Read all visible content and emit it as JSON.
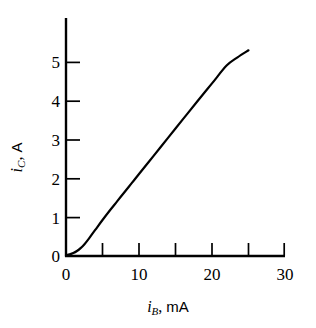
{
  "chart_data": {
    "type": "line",
    "title": "",
    "subtitle": "",
    "xlabel": "i_B, mA",
    "ylabel": "i_C, A",
    "xlabel_parts": {
      "symbol": "i",
      "subscript": "B",
      "separator": ",",
      "unit": "mA"
    },
    "ylabel_parts": {
      "symbol": "i",
      "subscript": "C",
      "separator": ",",
      "unit": "A"
    },
    "xlim": [
      0,
      30
    ],
    "ylim": [
      0,
      5.75
    ],
    "xticks": [
      0,
      10,
      20,
      30
    ],
    "xtick_labels": [
      "0",
      "10",
      "20",
      "30"
    ],
    "x_minor_ticks": [
      5,
      15,
      25
    ],
    "yticks": [
      0,
      1,
      2,
      3,
      4,
      5
    ],
    "ytick_labels": [
      "0",
      "1",
      "2",
      "3",
      "4",
      "5"
    ],
    "grid": false,
    "legend": null,
    "axis_style": "left-and-bottom-spines, inward ticks",
    "line_color": "#000000",
    "line_width_px": 2.2,
    "series": [
      {
        "name": "collector current vs base current",
        "x": [
          0.0,
          0.5,
          1.0,
          1.5,
          2.0,
          2.5,
          3.0,
          3.5,
          4.0,
          5.0,
          6.0,
          7.0,
          8.0,
          9.0,
          10.0,
          12.0,
          14.0,
          16.0,
          18.0,
          20.0,
          22.0,
          23.5,
          25.0
        ],
        "y": [
          0.02,
          0.04,
          0.07,
          0.12,
          0.19,
          0.28,
          0.39,
          0.51,
          0.63,
          0.87,
          1.1,
          1.32,
          1.54,
          1.76,
          1.98,
          2.42,
          2.86,
          3.3,
          3.74,
          4.17,
          4.6,
          4.8,
          4.97
        ]
      }
    ]
  },
  "axes_geometry": {
    "plot_left_px": 66,
    "plot_bottom_px": 256,
    "plot_top_px": 18,
    "plot_right_px": 285
  }
}
